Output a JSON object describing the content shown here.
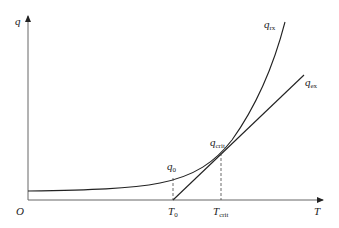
{
  "diagram": {
    "axes": {
      "y_label": "q",
      "x_label": "T",
      "origin_label": "O"
    },
    "curves": [
      {
        "name": "q",
        "subscript": "rx",
        "type": "exponential curve"
      },
      {
        "name": "q",
        "subscript": "ex",
        "type": "straight line"
      }
    ],
    "points": [
      {
        "name": "q",
        "subscript": "0"
      },
      {
        "name": "q",
        "subscript": "crit"
      }
    ],
    "x_ticks": [
      {
        "name": "T",
        "subscript": "0"
      },
      {
        "name": "T",
        "subscript": "crit"
      }
    ],
    "colors": {
      "line": "#222222",
      "axis": "#555555"
    }
  }
}
